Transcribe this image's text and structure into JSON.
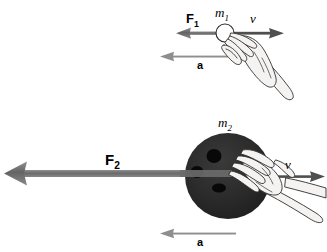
{
  "figure": {
    "background_color": "#ffffff",
    "width": 327,
    "height": 252
  },
  "colors": {
    "arrow_force": "#6e6e6e",
    "arrow_accel": "#8a8a8a",
    "arrow_velocity": "#5a5a5a",
    "ball_large": "#2b2b2b",
    "ball_hole": "#000000",
    "outline": "#000000",
    "hand_fill": "#f2f2f0",
    "hand_line": "#2a2a2a",
    "text": "#000000"
  },
  "panels": [
    {
      "id": "panel-small-mass",
      "name": "small-mass-scenario",
      "mass_label": "m",
      "mass_subscript": "2",
      "mass_label_full": "m1",
      "force_label": "F",
      "force_subscript": "1",
      "force_label_full": "F1",
      "velocity_label": "v",
      "acceleration_label": "a",
      "object": "small ball",
      "object_diameter_px": 18
    },
    {
      "id": "panel-large-mass",
      "name": "large-mass-scenario",
      "mass_label": "m",
      "mass_subscript": "2",
      "mass_label_full": "m2",
      "force_label": "F",
      "force_subscript": "2",
      "force_label_full": "F2",
      "velocity_label": "v",
      "acceleration_label": "a",
      "object": "bowling ball",
      "object_diameter_px": 86,
      "finger_holes": 3
    }
  ],
  "labels": {
    "top_force": "F",
    "top_force_sub": "1",
    "top_mass": "m",
    "top_mass_sub": "1",
    "top_velocity": "v",
    "top_accel": "a",
    "bottom_force": "F",
    "bottom_force_sub": "2",
    "bottom_mass": "m",
    "bottom_mass_sub": "2",
    "bottom_velocity": "v",
    "bottom_accel": "a"
  }
}
